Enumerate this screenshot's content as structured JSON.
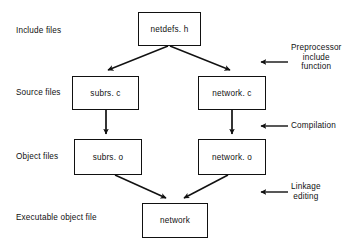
{
  "figure": {
    "background_color": "#ffffff",
    "line_color": "#111111",
    "text_color": "#111111"
  },
  "stage_labels": [
    {
      "id": "include-files",
      "text": "Include files"
    },
    {
      "id": "source-files",
      "text": "Source files"
    },
    {
      "id": "object-files",
      "text": "Object files"
    },
    {
      "id": "executable-object-file",
      "text": "Executable object file"
    }
  ],
  "nodes": [
    {
      "id": "netdefs-h",
      "label": "netdefs. h"
    },
    {
      "id": "subrs-c",
      "label": "subrs. c"
    },
    {
      "id": "network-c",
      "label": "network. c"
    },
    {
      "id": "subrs-o",
      "label": "subrs. o"
    },
    {
      "id": "network-o",
      "label": "network. o"
    },
    {
      "id": "network",
      "label": "network"
    }
  ],
  "annotations": [
    {
      "id": "preprocessor-include-function",
      "lines": [
        "Preprocessor",
        "include",
        "function"
      ],
      "text": "Preprocessor include function"
    },
    {
      "id": "compilation",
      "lines": [
        "Compilation"
      ],
      "text": "Compilation"
    },
    {
      "id": "linkage-editing",
      "lines": [
        "Linkage",
        "editing"
      ],
      "text": "Linkage editing"
    }
  ],
  "edges": [
    {
      "id": "netdefs-to-subrs-c",
      "from": "netdefs. h",
      "to": "subrs. c",
      "style": "diagonal-arrow"
    },
    {
      "id": "netdefs-to-network-c",
      "from": "netdefs. h",
      "to": "network. c",
      "style": "diagonal-arrow"
    },
    {
      "id": "subrs-c-to-subrs-o",
      "from": "subrs. c",
      "to": "subrs. o",
      "style": "vertical-arrow"
    },
    {
      "id": "network-c-to-network-o",
      "from": "network. c",
      "to": "network. o",
      "style": "vertical-arrow"
    },
    {
      "id": "subrs-o-to-network",
      "from": "subrs. o",
      "to": "network",
      "style": "diagonal-arrow"
    },
    {
      "id": "network-o-to-network",
      "from": "network. o",
      "to": "network",
      "style": "diagonal-arrow"
    }
  ]
}
